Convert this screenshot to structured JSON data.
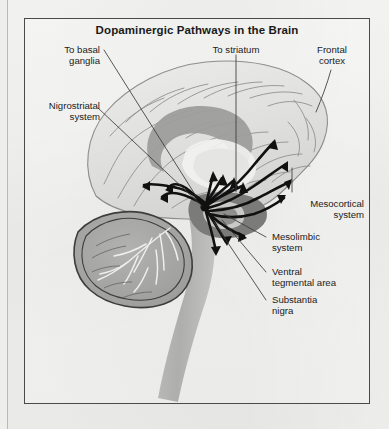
{
  "figure": {
    "title": "Dopaminergic Pathways in the Brain",
    "frame_color": "#4a4a4a",
    "background_color": "#f3f3f1"
  },
  "labels": [
    {
      "id": "to-basal-ganglia",
      "text": "To basal\nganglia",
      "align": "right"
    },
    {
      "id": "nigrostriatal",
      "text": "Nigrostriatal\nsystem",
      "align": "right"
    },
    {
      "id": "to-striatum",
      "text": "To striatum",
      "align": "center"
    },
    {
      "id": "frontal-cortex",
      "text": "Frontal\ncortex",
      "align": "center"
    },
    {
      "id": "mesocortical",
      "text": "Mesocortical\nsystem",
      "align": "right"
    },
    {
      "id": "mesolimbic",
      "text": "Mesolimbic\nsystem",
      "align": "left"
    },
    {
      "id": "ventral-tegmental",
      "text": "Ventral\ntegmental area",
      "align": "left"
    },
    {
      "id": "substantia-nigra",
      "text": "Substantia\nnigra",
      "align": "left"
    }
  ],
  "anatomy": {
    "cerebral_cortex": "cerebral-cortex",
    "cerebellum": "cerebellum",
    "brainstem": "brainstem",
    "corpus_callosum": "corpus-callosum",
    "striatum": "striatum",
    "substantia_nigra_region": "substantia-nigra-region",
    "ventral_tegmental_region": "ventral-tegmental-region",
    "pathway_origin": "pathway-origin-node"
  },
  "colors": {
    "cortex_fill": "#e3e3e1",
    "cortex_line": "#8d8d8b",
    "cerebellum_fill": "#a8a8a6",
    "cerebellum_line": "#3d3d3b",
    "brainstem_fill": "#b6b6b4",
    "deep_gray": "#9d9d9b",
    "dark_gray": "#7b7b79",
    "pathway_black": "#111111",
    "leader_line": "#3a3a3a"
  }
}
